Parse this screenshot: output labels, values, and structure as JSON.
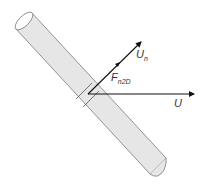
{
  "diagram": {
    "colors": {
      "cylinder_fill": "#e6e6e6",
      "cylinder_stroke": "#7a7a7a",
      "vector": "#111111",
      "text": "#333333"
    },
    "labels": {
      "normal_velocity": {
        "main": "U",
        "sub": "n"
      },
      "force": {
        "main": "F",
        "sub": "n2D"
      },
      "freestream": {
        "main": "U"
      }
    },
    "elements": [
      {
        "id": "cylinder",
        "type": "inclined-cylinder"
      },
      {
        "id": "strip-section",
        "type": "cross-section-strip"
      },
      {
        "id": "un-vector",
        "type": "arrow",
        "label": "U_n"
      },
      {
        "id": "u-vector",
        "type": "arrow",
        "label": "U"
      },
      {
        "id": "force-label",
        "type": "text",
        "label": "F_n2D"
      }
    ]
  }
}
